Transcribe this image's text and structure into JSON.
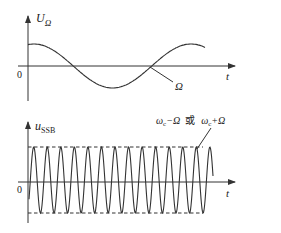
{
  "top_plot": {
    "y_label_main": "U",
    "y_label_sub": "Ω",
    "x_label": "t",
    "origin_label": "0",
    "curve_label": "Ω"
  },
  "bottom_plot": {
    "y_label_main": "u",
    "y_label_sub": "SSB",
    "x_label": "t",
    "origin_label": "0",
    "annotation": {
      "part1_omega": "ω",
      "part1_sub": "c",
      "part1_rest": "−Ω",
      "or": "或",
      "part2_omega": "ω",
      "part2_sub": "c",
      "part2_rest": "+Ω"
    }
  },
  "colors": {
    "line": "#333333",
    "background": "#ffffff"
  }
}
